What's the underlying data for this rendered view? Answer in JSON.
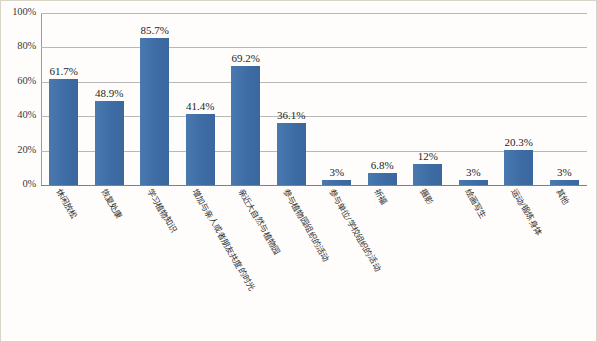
{
  "chart_data": {
    "type": "bar",
    "title": "",
    "subtitle": "",
    "xlabel": "",
    "ylabel": "",
    "ylim": [
      0,
      100
    ],
    "yticks": [
      "0%",
      "20%",
      "40%",
      "60%",
      "80%",
      "100%"
    ],
    "ytick_values": [
      0,
      20,
      40,
      60,
      80,
      100
    ],
    "grid": true,
    "legend": false,
    "legend_position": "none",
    "bar_color": "#3f6fa8",
    "categories": [
      "休闲放松",
      "恢复处康",
      "学习植物知识",
      "增加与亲人或者朋友共度的时光",
      "亲近大自然与植物园",
      "参与植物园组织的活动",
      "参与单位/学校组织的活动",
      "祈福",
      "摄影",
      "绘画写生",
      "运动/锻炼身体",
      "其他"
    ],
    "values": [
      61.7,
      48.9,
      85.7,
      41.4,
      69.2,
      36.1,
      3,
      6.8,
      12,
      3,
      20.3,
      3
    ],
    "data_labels": [
      "61.7%",
      "48.9%",
      "85.7%",
      "41.4%",
      "69.2%",
      "36.1%",
      "3%",
      "6.8%",
      "12%",
      "3%",
      "20.3%",
      "3%"
    ]
  }
}
